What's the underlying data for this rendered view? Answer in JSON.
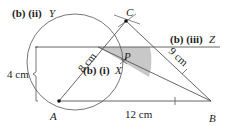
{
  "diagram": {
    "points": {
      "A": {
        "label": "A",
        "x": 59,
        "y": 101
      },
      "B": {
        "label": "B",
        "x": 211,
        "y": 101
      },
      "C": {
        "label": "C",
        "x": 126,
        "y": 21
      },
      "P": {
        "label": "P"
      },
      "X": {
        "label": "X"
      }
    },
    "labels": {
      "part_ii": "(b) (ii)",
      "part_ii_var": "Y",
      "part_iii": "(b) (iii)",
      "part_iii_var": "Z",
      "part_i": "(b) (i)",
      "part_i_var": "X",
      "AC_length": "8 cm",
      "BC_length": "9 cm",
      "AB_length": "12 cm",
      "height": "4 cm"
    },
    "colors": {
      "line": "#555555",
      "shade": "#c8c8c8",
      "text": "#222222"
    }
  }
}
